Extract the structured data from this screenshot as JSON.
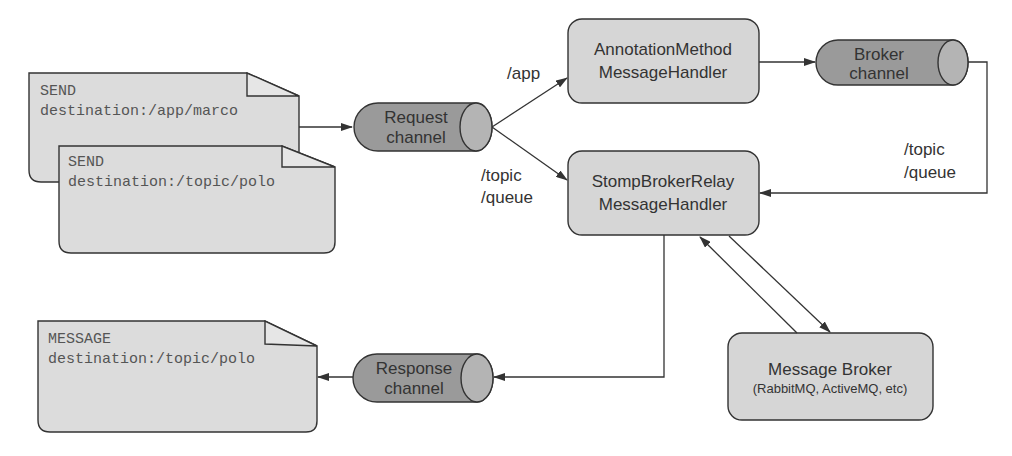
{
  "colors": {
    "doc_fill": "#dcdcdc",
    "handler_fill": "#d6d6d6",
    "channel_fill": "#9a9a9a",
    "channel_cap_fill": "#b4b4b4",
    "stroke": "#333333",
    "text": "#333333",
    "mono_text": "#555555"
  },
  "documents": {
    "send_app": {
      "line1": "SEND",
      "line2": "destination:/app/marco"
    },
    "send_topic": {
      "line1": "SEND",
      "line2": "destination:/topic/polo"
    },
    "message_out": {
      "line1": "MESSAGE",
      "line2": "destination:/topic/polo"
    }
  },
  "channels": {
    "request": {
      "line1": "Request",
      "line2": "channel"
    },
    "broker": {
      "line1": "Broker",
      "line2": "channel"
    },
    "response": {
      "line1": "Response",
      "line2": "channel"
    }
  },
  "handlers": {
    "annotation": {
      "line1": "AnnotationMethod",
      "line2": "MessageHandler"
    },
    "stomp_relay": {
      "line1": "StompBrokerRelay",
      "line2": "MessageHandler"
    },
    "message_broker": {
      "line1": "Message Broker",
      "line2": "(RabbitMQ, ActiveMQ, etc)"
    }
  },
  "edge_labels": {
    "app": "/app",
    "topic_queue_left": {
      "line1": "/topic",
      "line2": "/queue"
    },
    "topic_queue_right": {
      "line1": "/topic",
      "line2": "/queue"
    }
  }
}
